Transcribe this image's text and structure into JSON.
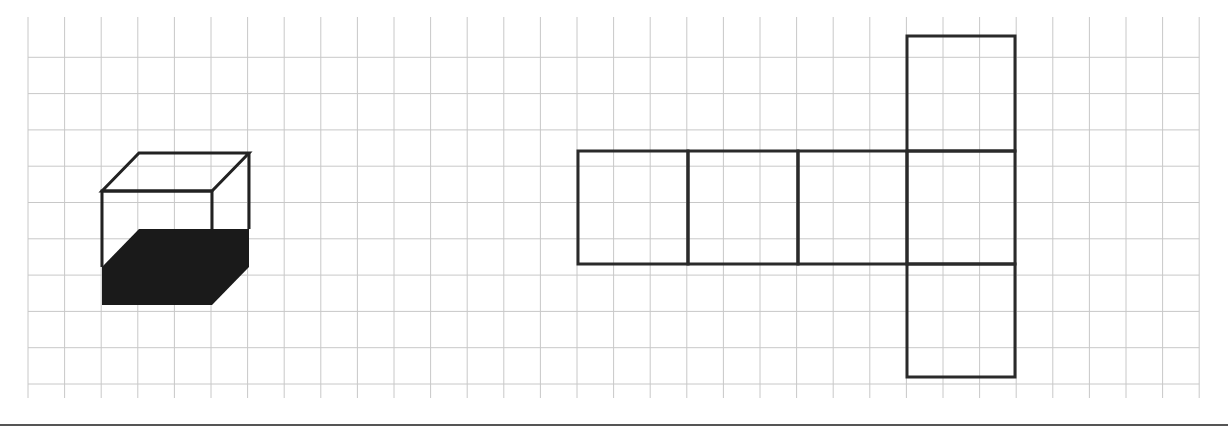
{
  "figure": {
    "grid": {
      "x0": 28,
      "y0": 17,
      "cell": 36.6,
      "cols": 32,
      "rows": 10,
      "line_color": "#c8c8c8",
      "top_y": 17,
      "bottom_y": 398
    },
    "cuboid": {
      "front": {
        "x": 102,
        "y": 191,
        "w": 110,
        "h": 114
      },
      "depth_offset": {
        "dx": 37,
        "dy": -38
      },
      "fill_level_y": 229,
      "fill_color": "#1a1a1a",
      "stroke_color": "#222222"
    },
    "net": {
      "stroke_color": "#2a2a2a",
      "row_faces": [
        {
          "x": 578,
          "y": 151,
          "w": 110,
          "h": 113
        },
        {
          "x": 688,
          "y": 151,
          "w": 110,
          "h": 113
        },
        {
          "x": 798,
          "y": 151,
          "w": 109,
          "h": 113
        },
        {
          "x": 907,
          "y": 151,
          "w": 108,
          "h": 113
        }
      ],
      "column_faces": [
        {
          "x": 907,
          "y": 36,
          "w": 108,
          "h": 115
        },
        {
          "x": 907,
          "y": 264,
          "w": 108,
          "h": 113
        }
      ]
    },
    "bottom_rule": {
      "y": 425,
      "color": "#555555"
    }
  }
}
